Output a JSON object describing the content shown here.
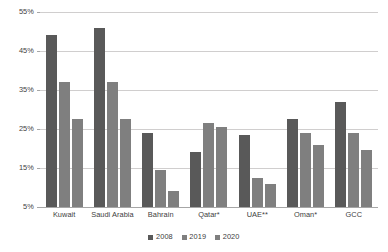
{
  "chart_data": {
    "type": "bar",
    "title": "",
    "subtitle": "",
    "xlabel": "",
    "ylabel": "",
    "categories": [
      "Kuwait",
      "Saudi Arabia",
      "Bahrain",
      "Qatar*",
      "UAE**",
      "Oman*",
      "GCC"
    ],
    "series": [
      {
        "name": "2008",
        "color": "#595959",
        "values": [
          49.0,
          51.0,
          24.0,
          19.0,
          23.5,
          27.5,
          32.0
        ]
      },
      {
        "name": "2019",
        "color": "#7f7f7f",
        "values": [
          37.0,
          37.0,
          14.5,
          26.5,
          12.5,
          24.0,
          24.0
        ]
      },
      {
        "name": "2020",
        "color": "#7f7f7f",
        "values": [
          27.5,
          27.5,
          9.0,
          25.5,
          11.0,
          21.0,
          19.5
        ]
      }
    ],
    "ylim": [
      5,
      55
    ],
    "yticks": [
      5,
      15,
      25,
      35,
      45,
      55
    ],
    "ytick_labels": [
      "5%",
      "15%",
      "25%",
      "35%",
      "45%",
      "55%"
    ],
    "grid": true,
    "legend_position": "bottom",
    "legend": [
      "2008",
      "2019",
      "2020"
    ],
    "annotations": []
  },
  "colors": {
    "gridline": "#d0cece",
    "axis": "#a6a6a6",
    "text": "#404040",
    "background": "#ffffff"
  }
}
